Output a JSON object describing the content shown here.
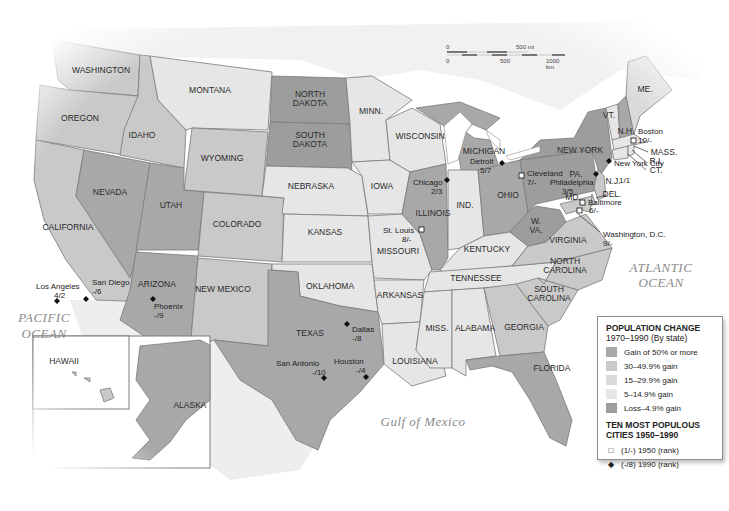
{
  "colors": {
    "gain_50_plus": "#a8a8a8",
    "gain_30_49": "#c9c9c9",
    "gain_15_29": "#dadada",
    "gain_5_14": "#e6e6e6",
    "loss_to_4_9": "#9d9d9d",
    "water": "#ffffff",
    "border": "#7a7a7a"
  },
  "oceans": {
    "pacific_line1": "PACIFIC",
    "pacific_line2": "OCEAN",
    "atlantic_line1": "ATLANTIC",
    "atlantic_line2": "OCEAN",
    "gulf": "Gulf of Mexico"
  },
  "scale_bar": {
    "mi_zero": "0",
    "mi_label": "500 mi",
    "km_zero": "0",
    "km_mid": "500",
    "km_label": "1000 km"
  },
  "states": {
    "washington": "WASHINGTON",
    "oregon": "OREGON",
    "california": "CALIFORNIA",
    "idaho": "IDAHO",
    "nevada": "NEVADA",
    "montana": "MONTANA",
    "wyoming": "WYOMING",
    "utah": "UTAH",
    "colorado": "COLORADO",
    "arizona": "ARIZONA",
    "new_mexico": "NEW MEXICO",
    "north_dakota_1": "NORTH",
    "north_dakota_2": "DAKOTA",
    "south_dakota_1": "SOUTH",
    "south_dakota_2": "DAKOTA",
    "nebraska": "NEBRASKA",
    "kansas": "KANSAS",
    "oklahoma": "OKLAHOMA",
    "texas": "TEXAS",
    "minnesota": "MINN.",
    "iowa": "IOWA",
    "missouri": "MISSOURI",
    "arkansas": "ARKANSAS",
    "louisiana": "LOUISIANA",
    "wisconsin": "WISCONSIN",
    "illinois": "ILLINOIS",
    "michigan": "MICHIGAN",
    "indiana": "IND.",
    "ohio": "OHIO",
    "kentucky": "KENTUCKY",
    "tennessee": "TENNESSEE",
    "mississippi": "MISS.",
    "alabama": "ALABAMA",
    "georgia": "GEORGIA",
    "florida": "FLORIDA",
    "south_carolina_1": "SOUTH",
    "south_carolina_2": "CAROLINA",
    "north_carolina_1": "NORTH",
    "north_carolina_2": "CAROLINA",
    "virginia": "VIRGINIA",
    "west_virginia_1": "W.",
    "west_virginia_2": "VA.",
    "pennsylvania": "PA.",
    "new_york": "NEW YORK",
    "vermont": "VT.",
    "new_hampshire": "N.H.",
    "maine": "ME.",
    "massachusetts": "MASS.",
    "rhode_island": "R.I.",
    "connecticut": "CT.",
    "new_jersey": "N.J.",
    "delaware": "DEL.",
    "maryland": "MD.",
    "hawaii": "HAWAII",
    "alaska": "ALASKA"
  },
  "cities": [
    {
      "name": "Los Angeles",
      "rank": "4/2",
      "marker": "1990"
    },
    {
      "name": "San Diego",
      "rank": "-/6",
      "marker": "1990"
    },
    {
      "name": "Phoenix",
      "rank": "-/9",
      "marker": "1990"
    },
    {
      "name": "Dallas",
      "rank": "-/8",
      "marker": "1990"
    },
    {
      "name": "San Antonio",
      "rank": "-/10",
      "marker": "1990"
    },
    {
      "name": "Houston",
      "rank": "-/4",
      "marker": "1990"
    },
    {
      "name": "St. Louis",
      "rank": "8/-",
      "marker": "1950"
    },
    {
      "name": "Chicago",
      "rank": "2/3",
      "marker": "1990"
    },
    {
      "name": "Detroit",
      "rank": "5/7",
      "marker": "1990"
    },
    {
      "name": "Cleveland",
      "rank": "7/-",
      "marker": "1950"
    },
    {
      "name": "Philadelphia",
      "rank": "3/5",
      "marker": "1990"
    },
    {
      "name": "New York City",
      "rank": "1/1",
      "marker": "1990"
    },
    {
      "name": "Baltimore",
      "rank": "6/-",
      "marker": "1950"
    },
    {
      "name": "Washington, D.C.",
      "rank": "9/-",
      "marker": "1950"
    },
    {
      "name": "Boston",
      "rank": "10/-",
      "marker": "1950"
    }
  ],
  "legend": {
    "title": "POPULATION CHANGE",
    "subtitle": "1970–1990 (By state)",
    "items": [
      {
        "label": "Gain of 50% or more"
      },
      {
        "label": "30–49.9% gain"
      },
      {
        "label": "15–29.9% gain"
      },
      {
        "label": "5–14.9% gain"
      },
      {
        "label": "Loss–4.9% gain"
      }
    ],
    "cities_title_1": "TEN MOST POPULOUS",
    "cities_title_2": "CITIES 1950–1990",
    "symbol_1950_glyph": "□",
    "symbol_1950_label": "(1/-) 1950 (rank)",
    "symbol_1990_glyph": "◆",
    "symbol_1990_label": "(-/8) 1990 (rank)"
  }
}
